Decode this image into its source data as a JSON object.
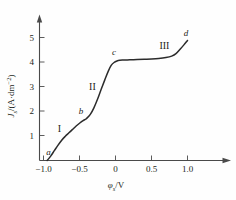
{
  "chart_data": {
    "type": "line",
    "title": "",
    "xlabel": "φₛ/V",
    "ylabel": "Jₛ/(A·dm⁻²)",
    "xlabel_parts": {
      "symbol": "φ",
      "subscript": "s",
      "unit": "/V"
    },
    "ylabel_parts": {
      "symbol": "J",
      "subscript": "s",
      "unit": "/(A·dm",
      "exponent": "−2",
      "close": ")"
    },
    "xlim": [
      -1.05,
      1.15
    ],
    "ylim": [
      0,
      5.45
    ],
    "xticks": [
      -1.0,
      -0.5,
      0,
      0.5,
      1.0
    ],
    "xtick_labels": [
      "−1.0",
      "−0.5",
      "0",
      "0.5",
      "1.0"
    ],
    "yticks": [
      1,
      2,
      3,
      4,
      5
    ],
    "ytick_labels": [
      "1",
      "2",
      "3",
      "4",
      "5"
    ],
    "grid": false,
    "legend": false,
    "x": [
      -0.95,
      -0.9,
      -0.85,
      -0.8,
      -0.75,
      -0.7,
      -0.65,
      -0.6,
      -0.55,
      -0.5,
      -0.45,
      -0.42,
      -0.4,
      -0.35,
      -0.3,
      -0.25,
      -0.2,
      -0.15,
      -0.1,
      -0.06,
      -0.02,
      0.02,
      0.06,
      0.1,
      0.2,
      0.3,
      0.4,
      0.5,
      0.6,
      0.7,
      0.78,
      0.84,
      0.9,
      0.95,
      1.0
    ],
    "y": [
      0.0,
      0.18,
      0.4,
      0.62,
      0.82,
      0.98,
      1.12,
      1.26,
      1.4,
      1.52,
      1.63,
      1.68,
      1.72,
      1.88,
      2.15,
      2.5,
      2.9,
      3.28,
      3.65,
      3.88,
      4.0,
      4.06,
      4.09,
      4.1,
      4.11,
      4.12,
      4.13,
      4.14,
      4.16,
      4.2,
      4.26,
      4.36,
      4.55,
      4.72,
      4.9
    ],
    "annotations": [
      {
        "name": "a",
        "label": "a",
        "x": -0.93,
        "y": 0.22,
        "style": "italic"
      },
      {
        "name": "b",
        "label": "b",
        "x": -0.48,
        "y": 1.88,
        "style": "italic"
      },
      {
        "name": "c",
        "label": "c",
        "x": -0.02,
        "y": 4.32,
        "style": "italic"
      },
      {
        "name": "d",
        "label": "d",
        "x": 0.98,
        "y": 5.08,
        "style": "italic"
      },
      {
        "name": "region-1",
        "label": "I",
        "x": -0.78,
        "y": 1.18,
        "style": "roman"
      },
      {
        "name": "region-2",
        "label": "II",
        "x": -0.32,
        "y": 2.88,
        "style": "roman"
      },
      {
        "name": "region-3",
        "label": "III",
        "x": 0.68,
        "y": 4.55,
        "style": "roman"
      }
    ],
    "series_name": "polarization-curve",
    "line_color": "#2b2b2b",
    "axis_color": "#4a4a4a",
    "background_color": "#fefefe"
  }
}
